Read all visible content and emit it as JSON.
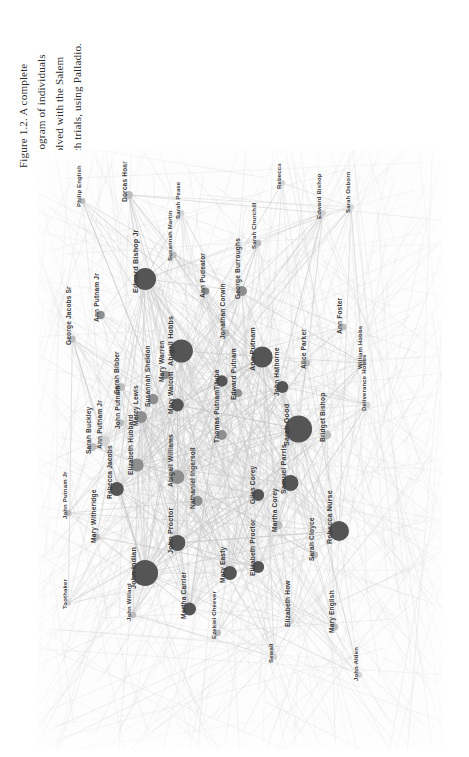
{
  "caption": {
    "text": "Figure 1.2. A complete\nsociogram of individuals\ninvolved with the Salem\nwitch trials, using Palladio."
  },
  "graph": {
    "title": "Salem witch trials sociogram",
    "tool": "Palladio",
    "background_color": "#fdfdfd",
    "edge_color": "#c9c9c9",
    "node_colors": {
      "dark": "#555555",
      "mid": "#8e8e8e",
      "light": "#bdbdbd",
      "pale": "#d4d4d4"
    }
  },
  "chart_data": {
    "type": "scatter",
    "title": "A complete sociogram of individuals involved with the Salem witch trials",
    "xlabel": "",
    "ylabel": "",
    "grid": false,
    "legend": null,
    "nodes": [
      {
        "label": "Philip English",
        "x": 0.11,
        "y": 0.085,
        "r": 3.0,
        "shade": "light"
      },
      {
        "label": "George Jacobs Sr",
        "x": 0.085,
        "y": 0.315,
        "r": 3.4,
        "shade": "light"
      },
      {
        "label": "Ann Putnam Jr",
        "x": 0.155,
        "y": 0.275,
        "r": 4.2,
        "shade": "mid"
      },
      {
        "label": "Dorcas Hoar",
        "x": 0.225,
        "y": 0.075,
        "r": 4.0,
        "shade": "light"
      },
      {
        "label": "Edward Bishop Jr",
        "x": 0.265,
        "y": 0.215,
        "r": 11.0,
        "shade": "dark"
      },
      {
        "label": "Susannah Martin",
        "x": 0.335,
        "y": 0.175,
        "r": 3.2,
        "shade": "light"
      },
      {
        "label": "Sarah Pease",
        "x": 0.355,
        "y": 0.105,
        "r": 3.0,
        "shade": "pale"
      },
      {
        "label": "Abigail Hobbs",
        "x": 0.355,
        "y": 0.335,
        "r": 11.5,
        "shade": "dark"
      },
      {
        "label": "Ann Pudeator",
        "x": 0.415,
        "y": 0.235,
        "r": 3.6,
        "shade": "mid"
      },
      {
        "label": "Jonathan Corwin",
        "x": 0.465,
        "y": 0.305,
        "r": 3.4,
        "shade": "light"
      },
      {
        "label": "George Burroughs",
        "x": 0.505,
        "y": 0.235,
        "r": 5.0,
        "shade": "mid"
      },
      {
        "label": "Sarah Churchill",
        "x": 0.545,
        "y": 0.155,
        "r": 3.2,
        "shade": "light"
      },
      {
        "label": "Rebecca",
        "x": 0.605,
        "y": 0.055,
        "r": 2.8,
        "shade": "pale"
      },
      {
        "label": "Ann Putnam",
        "x": 0.555,
        "y": 0.345,
        "r": 10.5,
        "shade": "dark"
      },
      {
        "label": "John Hathorne",
        "x": 0.605,
        "y": 0.395,
        "r": 6.0,
        "shade": "dark"
      },
      {
        "label": "Alice Parker",
        "x": 0.665,
        "y": 0.355,
        "r": 3.4,
        "shade": "light"
      },
      {
        "label": "Edward Bishop",
        "x": 0.705,
        "y": 0.105,
        "r": 3.0,
        "shade": "pale"
      },
      {
        "label": "Sarah Osborn",
        "x": 0.775,
        "y": 0.095,
        "r": 2.8,
        "shade": "pale"
      },
      {
        "label": "Ann Foster",
        "x": 0.755,
        "y": 0.295,
        "r": 3.6,
        "shade": "light"
      },
      {
        "label": "William Hobbs",
        "x": 0.805,
        "y": 0.355,
        "r": 3.0,
        "shade": "pale"
      },
      {
        "label": "Deliverance Hobbs",
        "x": 0.815,
        "y": 0.425,
        "r": 3.2,
        "shade": "pale"
      },
      {
        "label": "Mary Warren",
        "x": 0.315,
        "y": 0.375,
        "r": 4.2,
        "shade": "mid"
      },
      {
        "label": "Mary Walcott",
        "x": 0.345,
        "y": 0.425,
        "r": 6.4,
        "shade": "dark"
      },
      {
        "label": "Susannah Sheldon",
        "x": 0.285,
        "y": 0.415,
        "r": 5.2,
        "shade": "mid"
      },
      {
        "label": "Mercy Lewis",
        "x": 0.255,
        "y": 0.445,
        "r": 6.0,
        "shade": "mid"
      },
      {
        "label": "Sarah Bibber",
        "x": 0.205,
        "y": 0.395,
        "r": 4.0,
        "shade": "light"
      },
      {
        "label": "Tituba",
        "x": 0.455,
        "y": 0.385,
        "r": 5.8,
        "shade": "dark"
      },
      {
        "label": "Edward Putnam",
        "x": 0.495,
        "y": 0.405,
        "r": 4.0,
        "shade": "mid"
      },
      {
        "label": "Thomas Putnam",
        "x": 0.455,
        "y": 0.475,
        "r": 5.0,
        "shade": "mid"
      },
      {
        "label": "Sarah Good",
        "x": 0.645,
        "y": 0.465,
        "r": 13.5,
        "shade": "dark"
      },
      {
        "label": "Bridget Bishop",
        "x": 0.715,
        "y": 0.475,
        "r": 4.4,
        "shade": "light"
      },
      {
        "label": "Samuel Parris",
        "x": 0.625,
        "y": 0.555,
        "r": 8.0,
        "shade": "dark"
      },
      {
        "label": "Elizabeth Hubbard",
        "x": 0.245,
        "y": 0.525,
        "r": 6.6,
        "shade": "mid"
      },
      {
        "label": "Abigail Williams",
        "x": 0.345,
        "y": 0.545,
        "r": 7.0,
        "shade": "mid"
      },
      {
        "label": "Nathaniel Ingersoll",
        "x": 0.395,
        "y": 0.585,
        "r": 5.0,
        "shade": "mid"
      },
      {
        "label": "Giles Corey",
        "x": 0.545,
        "y": 0.575,
        "r": 6.0,
        "shade": "dark"
      },
      {
        "label": "Martha Corey",
        "x": 0.595,
        "y": 0.625,
        "r": 4.2,
        "shade": "light"
      },
      {
        "label": "Rebecca Nurse",
        "x": 0.745,
        "y": 0.635,
        "r": 10.0,
        "shade": "dark"
      },
      {
        "label": "Sarah Cloyce",
        "x": 0.685,
        "y": 0.675,
        "r": 3.4,
        "shade": "light"
      },
      {
        "label": "Sarah Buckley",
        "x": 0.135,
        "y": 0.495,
        "r": 4.0,
        "shade": "light"
      },
      {
        "label": "Ann Putnam Jr ",
        "x": 0.165,
        "y": 0.485,
        "r": 5.2,
        "shade": "pale"
      },
      {
        "label": "Rebecca Jacobs",
        "x": 0.195,
        "y": 0.565,
        "r": 7.0,
        "shade": "dark"
      },
      {
        "label": "John Putnam",
        "x": 0.205,
        "y": 0.455,
        "r": 3.4,
        "shade": "light"
      },
      {
        "label": "John Putnam Jr",
        "x": 0.075,
        "y": 0.605,
        "r": 3.2,
        "shade": "light"
      },
      {
        "label": "Mary Witheridge",
        "x": 0.145,
        "y": 0.645,
        "r": 3.4,
        "shade": "light"
      },
      {
        "label": "John Indian",
        "x": 0.265,
        "y": 0.705,
        "r": 13.0,
        "shade": "dark"
      },
      {
        "label": "John Willard",
        "x": 0.235,
        "y": 0.775,
        "r": 3.2,
        "shade": "light"
      },
      {
        "label": "Toothaker",
        "x": 0.075,
        "y": 0.755,
        "r": 2.8,
        "shade": "pale"
      },
      {
        "label": "John Proctor",
        "x": 0.345,
        "y": 0.655,
        "r": 8.0,
        "shade": "dark"
      },
      {
        "label": "Elizabeth Proctor",
        "x": 0.545,
        "y": 0.695,
        "r": 6.0,
        "shade": "dark"
      },
      {
        "label": "Mary Easty",
        "x": 0.475,
        "y": 0.705,
        "r": 7.0,
        "shade": "dark"
      },
      {
        "label": "Martha Carrier",
        "x": 0.375,
        "y": 0.765,
        "r": 6.5,
        "shade": "dark"
      },
      {
        "label": "Ezekiel Cheever",
        "x": 0.445,
        "y": 0.805,
        "r": 3.2,
        "shade": "light"
      },
      {
        "label": "Elizabeth How",
        "x": 0.625,
        "y": 0.785,
        "r": 3.4,
        "shade": "pale"
      },
      {
        "label": "Sewall",
        "x": 0.585,
        "y": 0.845,
        "r": 3.0,
        "shade": "pale"
      },
      {
        "label": "Mary English",
        "x": 0.735,
        "y": 0.795,
        "r": 3.4,
        "shade": "light"
      },
      {
        "label": "John Alden",
        "x": 0.795,
        "y": 0.875,
        "r": 3.0,
        "shade": "pale"
      }
    ],
    "node_count": 57,
    "edge_style": "straight light grey lines, high density",
    "node_size_encodes": "degree / number of connections",
    "node_shade_encodes": "degree / number of connections"
  }
}
